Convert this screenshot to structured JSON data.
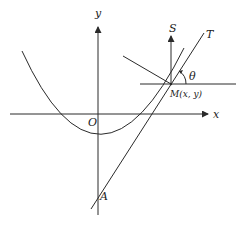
{
  "diagram": {
    "type": "geometry-figure",
    "labels": {
      "y_axis": "y",
      "x_axis": "x",
      "origin": "O",
      "vertical_ray": "S",
      "tangent": "T",
      "angle": "θ",
      "point": "M(x, y)",
      "intercept": "A"
    },
    "colors": {
      "stroke": "#2a2a2a",
      "background": "#ffffff"
    }
  }
}
